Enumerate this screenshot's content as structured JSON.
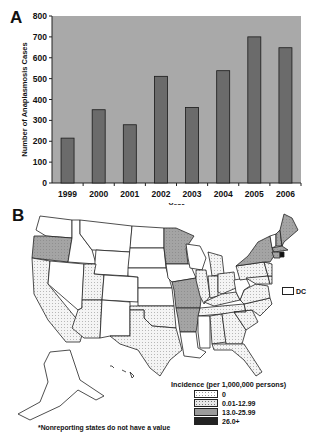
{
  "panel_a": {
    "letter": "A"
  },
  "panel_b": {
    "letter": "B"
  },
  "chart_data": [
    {
      "type": "bar",
      "title": "",
      "categories": [
        "1999",
        "2000",
        "2001",
        "2002",
        "2003",
        "2004",
        "2005",
        "2006"
      ],
      "values": [
        215,
        351,
        279,
        511,
        362,
        538,
        700,
        648
      ],
      "xlabel": "Year",
      "ylabel": "Number of Anaplasmosis Cases",
      "ylim": [
        0,
        800
      ],
      "yticks": [
        0,
        100,
        200,
        300,
        400,
        500,
        600,
        700,
        800
      ],
      "grid": false,
      "legend": "none",
      "colors": {
        "plot_bg": "#a9a9a9",
        "bar": "#6b6b6b",
        "bar_edge": "#1a1a1a"
      }
    },
    {
      "type": "choropleth",
      "title": "",
      "legend_title": "Incidence (per 1,000,000 persons)",
      "legend": [
        {
          "label": "0",
          "fill": "#ffffff"
        },
        {
          "label": "0.01-12.99",
          "fill": "#e8e8e8"
        },
        {
          "label": "13.0-25.99",
          "fill": "#9a9a9a"
        },
        {
          "label": "26.0+",
          "fill": "#222222"
        }
      ],
      "categories_by_state": {
        "0": [
          "WA",
          "ID",
          "MT",
          "WY",
          "NV",
          "CO",
          "NM",
          "ND",
          "SD",
          "NE",
          "KS",
          "IA",
          "WI",
          "MS",
          "LA",
          "WV",
          "VT",
          "DC"
        ],
        "0.01-12.99": [
          "CA",
          "UT",
          "AZ",
          "TX",
          "OK",
          "IL",
          "MI",
          "IN",
          "OH",
          "KY",
          "TN",
          "AL",
          "GA",
          "SC",
          "NC",
          "VA",
          "PA",
          "FL",
          "MD",
          "DE",
          "NJ"
        ],
        "13.0-25.99": [
          "OR",
          "MN",
          "MO",
          "AR",
          "NY",
          "ME",
          "NH",
          "MA",
          "CT"
        ],
        "26.0+": [
          "RI"
        ]
      },
      "annotations": [
        "DC",
        "*Nonreporting states do not have a value"
      ]
    }
  ],
  "map": {
    "legend_title": "Incidence (per 1,000,000 persons)",
    "legend_items": [
      {
        "label": "0"
      },
      {
        "label": "0.01-12.99"
      },
      {
        "label": "13.0-25.99"
      },
      {
        "label": "26.0+"
      }
    ],
    "dc_label": "DC",
    "footnote": "*Nonreporting states do not have a value"
  }
}
